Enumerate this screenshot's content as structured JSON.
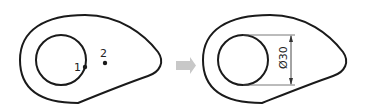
{
  "left_figure": {
    "point_labels": [
      "1",
      "2"
    ]
  },
  "arrow": {
    "color": "#c8c8c8"
  },
  "right_figure": {
    "dimension_label": "Ø30"
  },
  "colors": {
    "stroke": "#1a1a1a",
    "background": "#ffffff"
  }
}
